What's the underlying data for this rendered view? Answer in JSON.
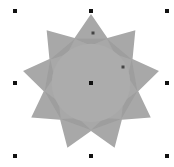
{
  "canvas": {
    "background": "#ffffff",
    "shape": {
      "type": "star",
      "points": 9,
      "center": [
        91,
        83
      ],
      "outer_radius": 69,
      "inner_radius": 48,
      "fill": "#a8a8a8",
      "overlap_fill": "#9c9c9c",
      "inner_circle_fill": "#acacac"
    },
    "selection_handles": [
      {
        "pos": "top-left",
        "x": 15,
        "y": 11
      },
      {
        "pos": "top-middle",
        "x": 91,
        "y": 11
      },
      {
        "pos": "top-right",
        "x": 167,
        "y": 11
      },
      {
        "pos": "middle-left",
        "x": 15,
        "y": 83
      },
      {
        "pos": "middle-right",
        "x": 167,
        "y": 83
      },
      {
        "pos": "bottom-left",
        "x": 15,
        "y": 156
      },
      {
        "pos": "bottom-middle",
        "x": 91,
        "y": 156
      },
      {
        "pos": "bottom-right",
        "x": 167,
        "y": 156
      }
    ],
    "center_handle": {
      "x": 91,
      "y": 83
    },
    "nodes": [
      {
        "name": "outer-node",
        "x": 93,
        "y": 33
      },
      {
        "name": "inner-node",
        "x": 123,
        "y": 67
      }
    ],
    "handle_color": "#111111",
    "node_color": "#444444"
  }
}
